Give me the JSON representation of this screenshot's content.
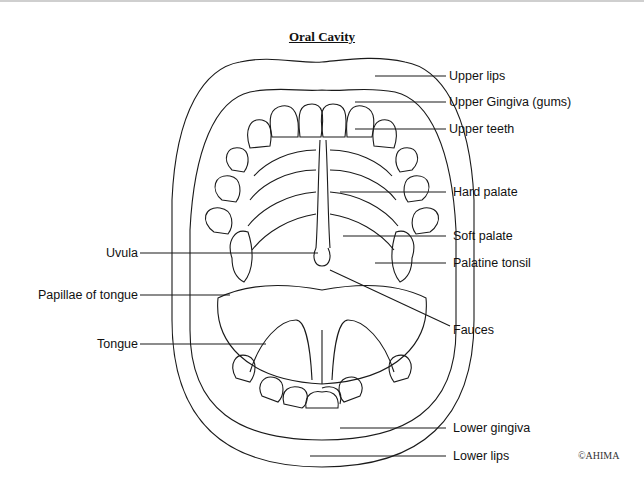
{
  "title": "Oral Cavity",
  "copyright": "©AHIMA",
  "labels_right": [
    {
      "id": "upper-lips",
      "text": "Upper lips",
      "y": 76
    },
    {
      "id": "upper-gingiva",
      "text": "Upper Gingiva (gums)",
      "y": 102
    },
    {
      "id": "upper-teeth",
      "text": "Upper teeth",
      "y": 129
    },
    {
      "id": "hard-palate",
      "text": "Hard palate",
      "y": 192
    },
    {
      "id": "soft-palate",
      "text": "Soft palate",
      "y": 236
    },
    {
      "id": "palatine-tonsil",
      "text": "Palatine tonsil",
      "y": 263
    },
    {
      "id": "fauces",
      "text": "Fauces",
      "y": 330
    },
    {
      "id": "lower-gingiva",
      "text": "Lower gingiva",
      "y": 428
    },
    {
      "id": "lower-lips",
      "text": "Lower lips",
      "y": 456
    }
  ],
  "labels_left": [
    {
      "id": "uvula",
      "text": "Uvula",
      "y": 253
    },
    {
      "id": "papillae-of-tongue",
      "text": "Papillae of tongue",
      "y": 295
    },
    {
      "id": "tongue",
      "text": "Tongue",
      "y": 344
    }
  ],
  "colors": {
    "line": "#1a1a1a",
    "text": "#111111",
    "background": "#ffffff"
  }
}
